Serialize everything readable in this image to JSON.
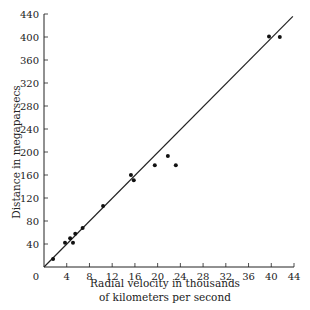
{
  "chart_data": {
    "type": "scatter",
    "title": "",
    "xlabel": "Radial velocity in thousands of kilometers per second",
    "xlabel_lines": [
      "Radial velocity in thousands",
      "of kilometers per second"
    ],
    "ylabel": "Distance in megaparsecs",
    "xlim": [
      0,
      44
    ],
    "ylim": [
      0,
      440
    ],
    "x_ticks": [
      0,
      4,
      8,
      12,
      16,
      20,
      24,
      28,
      32,
      36,
      40,
      44
    ],
    "y_ticks": [
      0,
      40,
      80,
      120,
      160,
      200,
      240,
      280,
      320,
      360,
      400,
      440
    ],
    "grid": false,
    "legend": null,
    "series": [
      {
        "name": "galaxies",
        "x": [
          1.6,
          3.7,
          4.6,
          5.1,
          5.5,
          6.8,
          10.4,
          15.3,
          15.8,
          19.5,
          21.8,
          23.2,
          39.6,
          41.5
        ],
        "y": [
          14,
          42,
          50,
          42,
          58,
          68,
          106,
          160,
          151,
          177,
          193,
          177,
          401,
          400
        ]
      }
    ],
    "fit_line": {
      "x": [
        0,
        43.8
      ],
      "y": [
        0,
        436
      ]
    }
  }
}
